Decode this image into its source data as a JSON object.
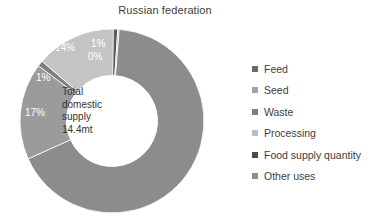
{
  "chart_data": {
    "type": "pie",
    "variant": "donut",
    "title": "Russian federation",
    "center_label": [
      "Total",
      "domestic",
      "supply",
      "14.4mt"
    ],
    "center_label_text": "Total domestic supply 14.4mt",
    "total_value": "14.4mt",
    "units": "percent of total domestic supply",
    "categories": [
      "Feed",
      "Seed",
      "Waste",
      "Processing",
      "Food supply quantity",
      "Other uses"
    ],
    "values": [
      1,
      0,
      1,
      14,
      67,
      17
    ],
    "data_labels": [
      "1%",
      "0%",
      "1%",
      "14%",
      "67%",
      "17%"
    ],
    "colors": [
      "#595959",
      "#a6a6a6",
      "#808080",
      "#c4c4c4",
      "#8c8c8c",
      "#9b9b9b"
    ],
    "legend_swatch_colors": [
      "#6b6b6b",
      "#a3a3a3",
      "#7d7d7d",
      "#bdbdbd",
      "#4a4a4a",
      "#8f8f8f"
    ],
    "legend_position": "right",
    "start_angle_deg": 0,
    "direction": "clockwise",
    "grid": false,
    "xlabel": "",
    "ylabel": "",
    "slices": [
      {
        "label": "Feed",
        "value": 1,
        "data_label": "1%",
        "color": "#595959"
      },
      {
        "label": "Seed",
        "value": 0,
        "data_label": "0%",
        "color": "#a6a6a6"
      },
      {
        "label": "Waste",
        "value": 1,
        "data_label": "1%",
        "color": "#808080"
      },
      {
        "label": "Processing",
        "value": 14,
        "data_label": "14%",
        "color": "#c4c4c4"
      },
      {
        "label": "Food supply quantity",
        "value": 67,
        "data_label": "67%",
        "color": "#8c8c8c"
      },
      {
        "label": "Other uses",
        "value": 17,
        "data_label": "17%",
        "color": "#9b9b9b"
      }
    ]
  },
  "legend": {
    "items": [
      {
        "label": "Feed"
      },
      {
        "label": "Seed"
      },
      {
        "label": "Waste"
      },
      {
        "label": "Processing"
      },
      {
        "label": "Food supply quantity"
      },
      {
        "label": "Other uses"
      }
    ]
  }
}
